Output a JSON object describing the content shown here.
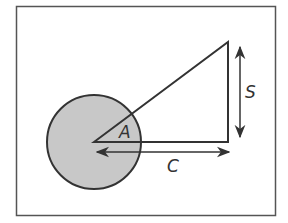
{
  "diagram": {
    "labels": {
      "angle": "A",
      "opposite_side": "S",
      "adjacent_side": "C"
    },
    "colors": {
      "stroke": "#333333",
      "circle_fill": "#c8c8c8",
      "background": "#ffffff",
      "frame": "#555555"
    },
    "shapes": {
      "frame": {
        "x": 16,
        "y": 6,
        "width": 260,
        "height": 210
      },
      "circle": {
        "cx": 94,
        "cy": 142,
        "r": 47
      },
      "triangle": {
        "vertices": [
          [
            94,
            142
          ],
          [
            228,
            42
          ],
          [
            228,
            142
          ]
        ]
      },
      "arrow_s": {
        "x": 240,
        "y1": 48,
        "y2": 137
      },
      "arrow_c": {
        "y": 152,
        "x1": 97,
        "x2": 229
      }
    }
  }
}
